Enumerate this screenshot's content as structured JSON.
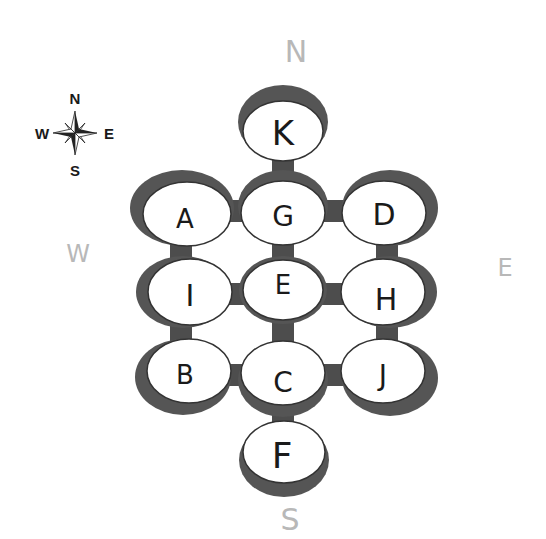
{
  "compass_rose": {
    "north": "N",
    "south": "S",
    "east": "E",
    "west": "W",
    "icon": "compass-rose-icon"
  },
  "direction_labels": {
    "north": "N",
    "south": "S",
    "east": "E",
    "west": "W"
  },
  "colors": {
    "connector": "#4d4d4d",
    "shadow": "#555555",
    "node_fill": "#ffffff",
    "direction_label": "#b8b8b8",
    "node_label": "#1a1a1a"
  },
  "nodes": [
    {
      "id": "K",
      "label": "K",
      "row": 0,
      "col": 1
    },
    {
      "id": "A",
      "label": "A",
      "row": 1,
      "col": 0
    },
    {
      "id": "G",
      "label": "G",
      "row": 1,
      "col": 1
    },
    {
      "id": "D",
      "label": "D",
      "row": 1,
      "col": 2
    },
    {
      "id": "I",
      "label": "I",
      "row": 2,
      "col": 0
    },
    {
      "id": "E",
      "label": "E",
      "row": 2,
      "col": 1
    },
    {
      "id": "H",
      "label": "H",
      "row": 2,
      "col": 2
    },
    {
      "id": "B",
      "label": "B",
      "row": 3,
      "col": 0
    },
    {
      "id": "C",
      "label": "C",
      "row": 3,
      "col": 1
    },
    {
      "id": "J",
      "label": "J",
      "row": 3,
      "col": 2
    },
    {
      "id": "F",
      "label": "F",
      "row": 4,
      "col": 1
    }
  ],
  "connections": [
    [
      "K",
      "G"
    ],
    [
      "A",
      "G"
    ],
    [
      "G",
      "D"
    ],
    [
      "A",
      "I"
    ],
    [
      "G",
      "E"
    ],
    [
      "D",
      "H"
    ],
    [
      "I",
      "E"
    ],
    [
      "E",
      "H"
    ],
    [
      "I",
      "B"
    ],
    [
      "E",
      "C"
    ],
    [
      "H",
      "J"
    ],
    [
      "B",
      "C"
    ],
    [
      "C",
      "J"
    ],
    [
      "C",
      "F"
    ]
  ]
}
